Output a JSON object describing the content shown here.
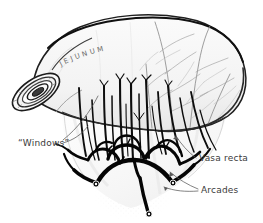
{
  "figure": {
    "medium": "pen-and-ink anatomical drawing",
    "background_color": "#ffffff",
    "ink_color": "#1a1a1a",
    "mid_tone_color": "#6a6a6a",
    "light_tone_color": "#b5b5b5",
    "label_color": "#3a3a3a"
  },
  "organ_label": {
    "text": "JEJUNUM",
    "style": "letter-spaced capitals curved along bowel"
  },
  "labels": [
    {
      "id": "windows",
      "text": "“Windows”",
      "position": "left",
      "leader": "two thin lines angling up-right into translucent gaps of mesentery"
    },
    {
      "id": "vasa-recta",
      "text": "Vasa recta",
      "position": "right",
      "leader": "thin line angling up-left to the straight parallel vessels"
    },
    {
      "id": "arcades",
      "text": "Arcades",
      "position": "lower-right",
      "leader": "two thin lines angling left to the looping arterial arcades"
    }
  ],
  "structures": [
    {
      "id": "bowel-loop",
      "name": "Jejunal loop",
      "description": "broad curved tube of small intestine arching across the top"
    },
    {
      "id": "cut-end",
      "name": "Cut end of jejunum",
      "description": "obliquely sectioned open lumen at left showing concentric bowel wall rings"
    },
    {
      "id": "mesentery",
      "name": "Mesentery",
      "description": "fan-shaped translucent membrane hanging below the bowel"
    },
    {
      "id": "vasa-recta",
      "name": "Vasa recta",
      "description": "long straight parallel vessels running from arcades to bowel wall"
    },
    {
      "id": "arcades",
      "name": "Arterial arcades",
      "description": "thick dark looping anastomotic vessels at base of mesentery"
    },
    {
      "id": "windows",
      "name": "Mesenteric windows",
      "description": "translucent avascular gaps between vasa recta"
    },
    {
      "id": "serosal-vessels",
      "name": "Serosal vessels",
      "description": "fine pale branching vessels over the bowel surface at upper right"
    }
  ]
}
